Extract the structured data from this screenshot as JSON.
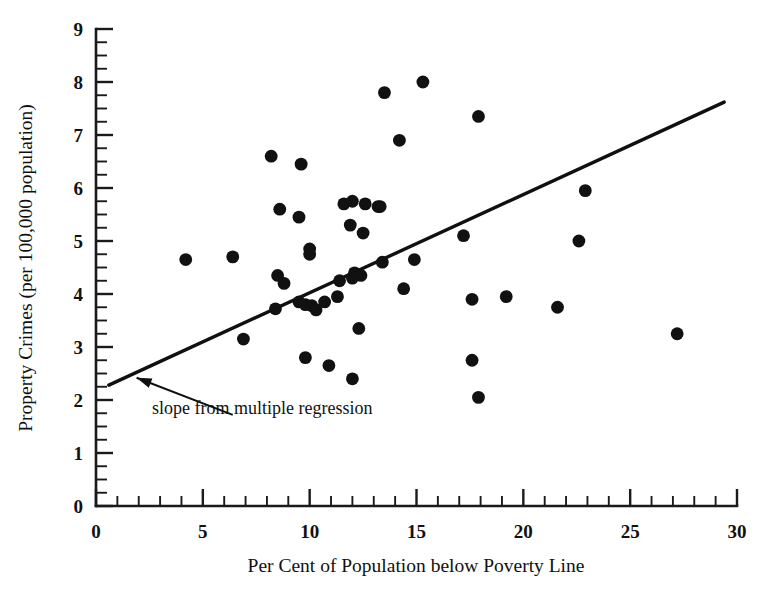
{
  "chart_data": {
    "type": "scatter",
    "title": "",
    "xlabel": "Per Cent of Population below Poverty Line",
    "ylabel": "Property Crimes (per 100,000 population)",
    "xlim": [
      0,
      30
    ],
    "ylim": [
      0,
      9
    ],
    "xticks": [
      0,
      5,
      10,
      15,
      20,
      25,
      30
    ],
    "xtick_labels": [
      "0",
      "5",
      "10",
      "15",
      "20",
      "25",
      "30"
    ],
    "yticks": [
      0,
      1,
      2,
      3,
      4,
      5,
      6,
      7,
      8,
      9
    ],
    "ytick_labels": [
      "0",
      "1",
      "2",
      "3",
      "4",
      "5",
      "6",
      "7",
      "8",
      "9"
    ],
    "x_minor_tick_interval": 1,
    "y_minor_tick_interval": 0.25,
    "grid": false,
    "legend": "none",
    "marker": "filled-circle",
    "marker_color": "#111111",
    "points": [
      {
        "x": 4.2,
        "y": 4.65
      },
      {
        "x": 6.4,
        "y": 4.7
      },
      {
        "x": 6.9,
        "y": 3.15
      },
      {
        "x": 8.2,
        "y": 6.6
      },
      {
        "x": 8.6,
        "y": 5.6
      },
      {
        "x": 8.5,
        "y": 4.35
      },
      {
        "x": 8.8,
        "y": 4.2
      },
      {
        "x": 8.4,
        "y": 3.72
      },
      {
        "x": 9.6,
        "y": 6.45
      },
      {
        "x": 9.5,
        "y": 5.45
      },
      {
        "x": 10.0,
        "y": 4.85
      },
      {
        "x": 10.0,
        "y": 4.75
      },
      {
        "x": 9.5,
        "y": 3.85
      },
      {
        "x": 9.8,
        "y": 3.8
      },
      {
        "x": 10.1,
        "y": 3.78
      },
      {
        "x": 10.3,
        "y": 3.7
      },
      {
        "x": 9.8,
        "y": 2.8
      },
      {
        "x": 10.7,
        "y": 3.85
      },
      {
        "x": 10.9,
        "y": 2.65
      },
      {
        "x": 11.4,
        "y": 4.25
      },
      {
        "x": 11.3,
        "y": 3.95
      },
      {
        "x": 12.0,
        "y": 5.75
      },
      {
        "x": 11.9,
        "y": 5.3
      },
      {
        "x": 12.1,
        "y": 4.4
      },
      {
        "x": 12.0,
        "y": 4.3
      },
      {
        "x": 11.6,
        "y": 5.7
      },
      {
        "x": 12.6,
        "y": 5.7
      },
      {
        "x": 12.5,
        "y": 5.15
      },
      {
        "x": 12.4,
        "y": 4.35
      },
      {
        "x": 12.3,
        "y": 3.35
      },
      {
        "x": 12.0,
        "y": 2.4
      },
      {
        "x": 13.2,
        "y": 5.65
      },
      {
        "x": 13.5,
        "y": 7.8
      },
      {
        "x": 13.3,
        "y": 5.65
      },
      {
        "x": 13.4,
        "y": 4.6
      },
      {
        "x": 14.2,
        "y": 6.9
      },
      {
        "x": 14.4,
        "y": 4.1
      },
      {
        "x": 15.3,
        "y": 8.0
      },
      {
        "x": 14.9,
        "y": 4.65
      },
      {
        "x": 17.2,
        "y": 5.1
      },
      {
        "x": 17.9,
        "y": 7.35
      },
      {
        "x": 17.6,
        "y": 3.9
      },
      {
        "x": 17.6,
        "y": 2.75
      },
      {
        "x": 17.9,
        "y": 2.05
      },
      {
        "x": 19.2,
        "y": 3.95
      },
      {
        "x": 21.6,
        "y": 3.75
      },
      {
        "x": 22.6,
        "y": 5.0
      },
      {
        "x": 22.9,
        "y": 5.95
      },
      {
        "x": 27.2,
        "y": 3.25
      }
    ],
    "fit_line": {
      "label": "slope from multiple regression",
      "x_start": 0.6,
      "y_start": 2.28,
      "x_end": 29.4,
      "y_end": 7.62
    },
    "annotation": {
      "text": "slope from multiple regression",
      "arrow_from_x": 6.4,
      "arrow_from_y": 1.72,
      "arrow_to_x": 1.9,
      "arrow_to_y": 2.42
    }
  }
}
